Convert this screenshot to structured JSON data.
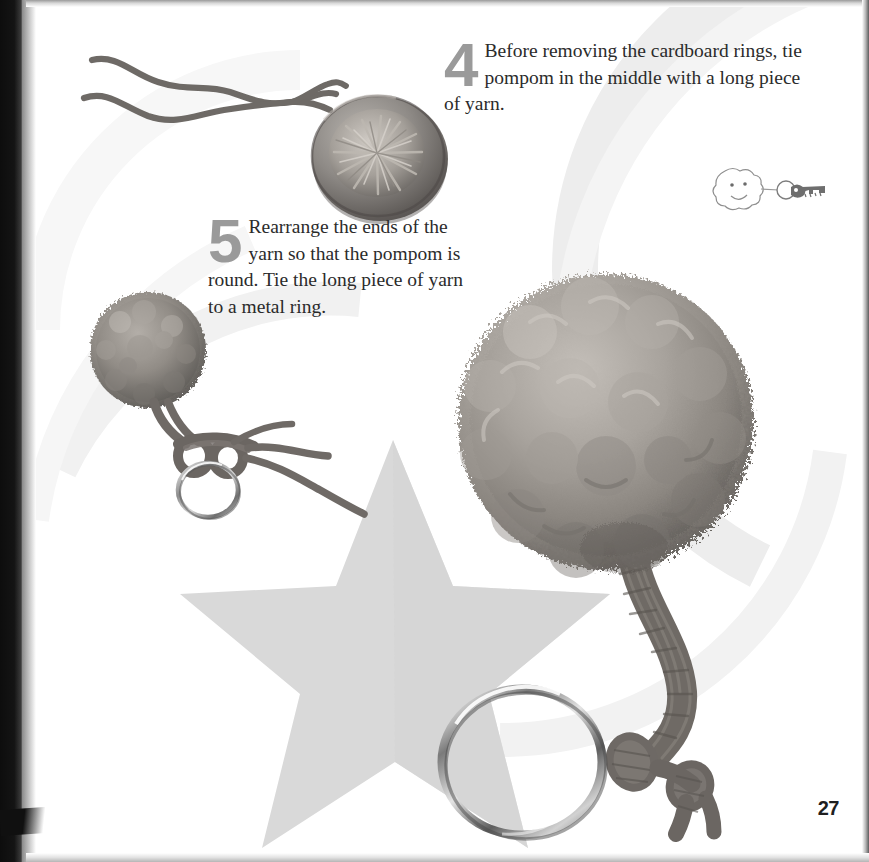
{
  "page": {
    "number": "27",
    "background_color": "#ffffff",
    "border_color": "#111111",
    "accent_gray": "#9a9a9a",
    "text_color": "#2b2b2b",
    "decor_gray": "#e8e8e8",
    "star_gray": "#d6d6d6"
  },
  "steps": [
    {
      "number": "4",
      "text": "Before removing the cardboard rings, tie pompom in the middle with a long piece of yarn."
    },
    {
      "number": "5",
      "text": "Rearrange the ends of the yarn so that the pompom is round. Tie the long piece of yarn to a metal ring."
    }
  ],
  "illustrations": {
    "doodle_label": "smiling pompom keychain with key sketch"
  },
  "photos": [
    {
      "name": "pompom-in-cardboard-rings",
      "caption": "pompom tied in cardboard rings with two long yarn strands"
    },
    {
      "name": "small-pompom-with-ring",
      "caption": "finished small pompom knotted onto a metal split ring"
    },
    {
      "name": "large-pompom-keychain",
      "caption": "large fluffy pompom with braided yarn cord knotted to a metal key ring"
    }
  ]
}
